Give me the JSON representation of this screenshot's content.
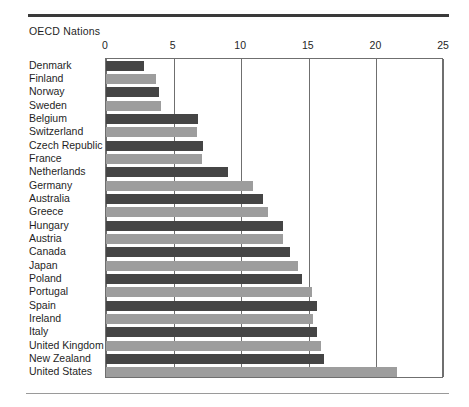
{
  "page": {
    "title": "OECD Nations",
    "top_rule": true,
    "bottom_rule": true
  },
  "chart_data": {
    "type": "bar",
    "orientation": "horizontal",
    "title": "OECD Nations",
    "xlabel": "",
    "ylabel": "",
    "xlim": [
      0,
      25
    ],
    "xticks": [
      0,
      5,
      10,
      15,
      20,
      25
    ],
    "tick_labels": [
      "0",
      "5",
      "10",
      "15",
      "20",
      "25"
    ],
    "grid": true,
    "legend": "none",
    "colors": {
      "dark_bar": "#454545",
      "light_bar": "#9d9d9d",
      "axis": "#6f6f6f",
      "text": "#1f1f1f",
      "rule": "#3a3a3a"
    },
    "categories": [
      "Denmark",
      "Finland",
      "Norway",
      "Sweden",
      "Belgium",
      "Switzerland",
      "Czech Republic",
      "France",
      "Netherlands",
      "Germany",
      "Australia",
      "Greece",
      "Hungary",
      "Austria",
      "Canada",
      "Japan",
      "Poland",
      "Portugal",
      "Spain",
      "Ireland",
      "Italy",
      "United Kingdom",
      "New Zealand",
      "United States"
    ],
    "values": [
      2.8,
      3.7,
      3.9,
      4.1,
      6.8,
      6.7,
      7.2,
      7.1,
      9.0,
      10.9,
      11.6,
      12.0,
      13.1,
      13.1,
      13.6,
      14.2,
      14.5,
      15.2,
      15.6,
      15.3,
      15.6,
      15.9,
      16.1,
      21.5
    ],
    "bar_shades": [
      "dark",
      "light",
      "dark",
      "light",
      "dark",
      "light",
      "dark",
      "light",
      "dark",
      "light",
      "dark",
      "light",
      "dark",
      "light",
      "dark",
      "light",
      "dark",
      "light",
      "dark",
      "light",
      "dark",
      "light",
      "dark",
      "light"
    ]
  }
}
